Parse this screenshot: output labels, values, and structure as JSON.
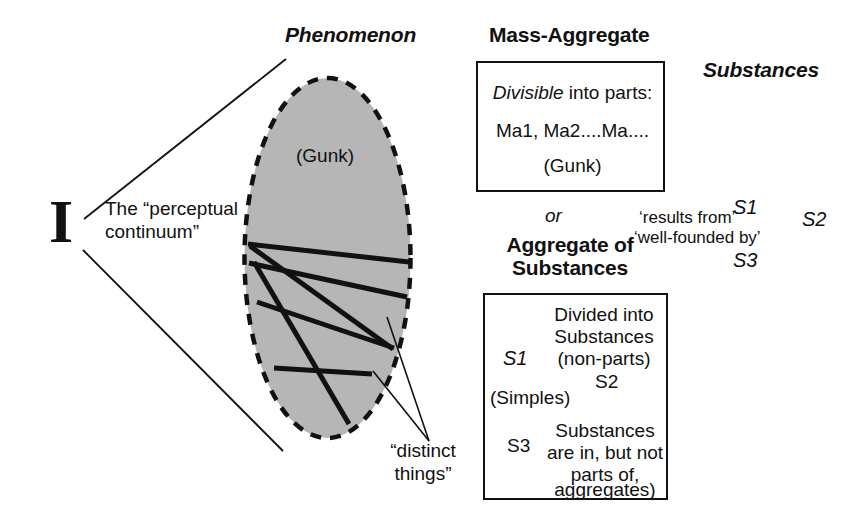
{
  "diagram": {
    "title_left": "Phenomenon",
    "bracket_symbol": "I",
    "perceptual_label_line1": "The “perceptual",
    "perceptual_label_line2": "continuum”",
    "ellipse_label": "(Gunk)",
    "distinct_things_line1": "“distinct",
    "distinct_things_line2": "things”",
    "mass_aggregate_heading": "Mass-Aggregate",
    "mass_aggregate_box": {
      "line1_emphasis": "Divisible",
      "line1_rest": " into parts:",
      "line2": "Ma1, Ma2....Ma....",
      "line3": "(Gunk)"
    },
    "or_connector": "or",
    "aggregate_heading_line1": "Aggregate of",
    "aggregate_heading_line2": "Substances",
    "aggregate_box": {
      "line1": "Divided into",
      "line2": "Substances",
      "line3": "(non-parts)",
      "label_s1": "S1",
      "label_s2": "S2",
      "label_s3": "S3",
      "simples": "(Simples)",
      "note_line1": "Substances",
      "note_line2": "are in, but not",
      "note_line3": "parts of,",
      "note_line4": "aggregates)"
    },
    "substances_heading": "Substances",
    "substances_labels": {
      "s1": "S1",
      "s2": "S2",
      "s3": "S3"
    },
    "relation_line1": "‘results from’",
    "relation_line2": "‘well-founded by’",
    "colors": {
      "ink": "#111111",
      "gunk_fill": "#b6b6b6",
      "page": "#ffffff"
    }
  }
}
